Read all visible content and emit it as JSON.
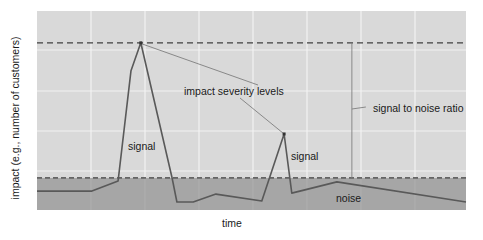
{
  "chart_data": {
    "type": "line",
    "title": "",
    "xlabel": "time",
    "ylabel": "impact (e.g., number of customers)",
    "grid": true,
    "x_ticks_shown": false,
    "y_ticks_shown": false,
    "xlim": [
      0,
      100
    ],
    "ylim": [
      0,
      100
    ],
    "series": [
      {
        "name": "impact",
        "x": [
          0,
          12.8,
          18.9,
          21.9,
          24.2,
          31.5,
          32.6,
          36.4,
          41.7,
          52.4,
          57.6,
          59.4,
          69.9,
          100
        ],
        "y": [
          9.5,
          9.5,
          14.6,
          70.0,
          84.0,
          16.1,
          4.0,
          4.0,
          8.0,
          4.5,
          38.2,
          8.5,
          14.1,
          4.0
        ]
      }
    ],
    "reference_lines": [
      {
        "name": "max-impact-level",
        "y": 84.0,
        "style": "dashed"
      },
      {
        "name": "noise-level",
        "y": 16.1,
        "style": "dashed"
      }
    ],
    "bands": [
      {
        "name": "noise-band",
        "y_from": 0,
        "y_to": 16.1,
        "color": "#a6a6a6"
      }
    ],
    "annotations": [
      {
        "text": "impact severity levels",
        "points_to": [
          [
            24.2,
            84.0
          ],
          [
            57.6,
            38.2
          ]
        ]
      },
      {
        "text": "signal",
        "near": [
          20,
          35
        ]
      },
      {
        "text": "signal",
        "near": [
          58,
          30
        ]
      },
      {
        "text": "noise",
        "near": [
          69,
          4
        ]
      },
      {
        "text": "signal to noise ratio",
        "spans_y": [
          16.1,
          84.0
        ],
        "at_x": 73.4
      }
    ]
  },
  "colors": {
    "plot_background": "#d9d9d9",
    "noise_band": "#a6a6a6",
    "gridline": "#f2f2f2",
    "series_line": "#595959",
    "dashed_line": "#404040",
    "annotation_line": "#7f7f7f",
    "text": "#1a1a1a"
  },
  "labels": {
    "y_axis": "impact (e.g., number of customers)",
    "x_axis": "time",
    "impact_severity": "impact severity levels",
    "signal_1": "signal",
    "signal_2": "signal",
    "noise": "noise",
    "snr": "signal to noise ratio"
  }
}
